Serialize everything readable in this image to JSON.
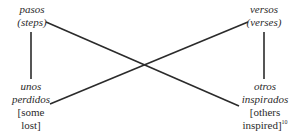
{
  "diagram": {
    "type": "chiasmus",
    "nodes": {
      "top_left": {
        "spanish": "pasos",
        "english": "(steps)"
      },
      "top_right": {
        "spanish": "versos",
        "english": "(verses)"
      },
      "bottom_left": {
        "spanish_1": "unos",
        "spanish_2": "perdidos",
        "english_1": "[some",
        "english_2": "lost]"
      },
      "bottom_right": {
        "spanish_1": "otros",
        "spanish_2": "inspirados",
        "english_1": "[others",
        "english_2": "inspired]",
        "footnote": "10"
      }
    },
    "edges": [
      {
        "from": "top_left",
        "to": "bottom_left"
      },
      {
        "from": "top_right",
        "to": "bottom_right"
      },
      {
        "from": "top_left",
        "to": "bottom_right"
      },
      {
        "from": "top_right",
        "to": "bottom_left"
      }
    ],
    "line_color": "#2b2b2b"
  }
}
